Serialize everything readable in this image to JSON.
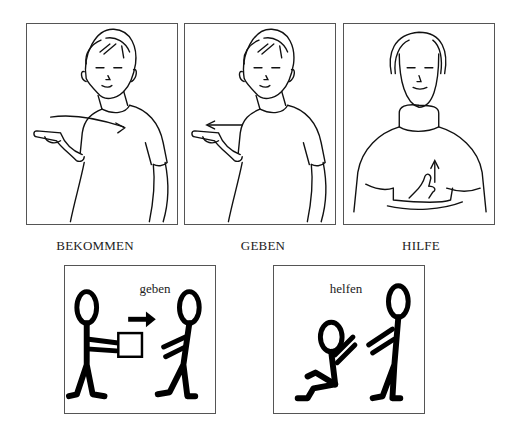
{
  "sign_illustrations": [
    {
      "id": "bekommen",
      "caption": "BEKOMMEN",
      "arrow_direction": "toward-body"
    },
    {
      "id": "geben",
      "caption": "GEBEN",
      "arrow_direction": "away-from-body"
    },
    {
      "id": "hilfe",
      "caption": "HILFE",
      "arrow_direction": "up"
    }
  ],
  "pictograms": [
    {
      "id": "geben",
      "label": "geben"
    },
    {
      "id": "helfen",
      "label": "helfen"
    }
  ]
}
